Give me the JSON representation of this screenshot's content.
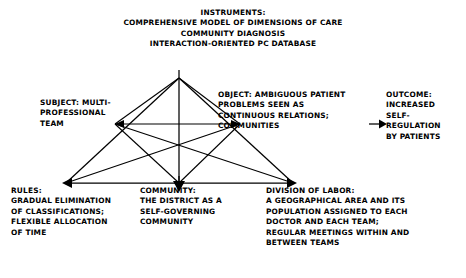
{
  "diagram": {
    "type": "activity-system-triangle",
    "title_text": "",
    "nodes": {
      "instruments": {
        "role": "INSTRUMENTS",
        "text": "INSTRUMENTS:\nCOMPREHENSIVE MODEL OF DIMENSIONS OF CARE\nCOMMUNITY DIAGNOSIS\nINTERACTION-ORIENTED PC DATABASE",
        "lines": [
          "INSTRUMENTS:",
          "COMPREHENSIVE MODEL OF DIMENSIONS OF CARE",
          "COMMUNITY DIAGNOSIS",
          "INTERACTION-ORIENTED PC DATABASE"
        ],
        "vertex": {
          "x": 179,
          "y": 78
        }
      },
      "subject": {
        "role": "SUBJECT",
        "text": "SUBJECT: MULTI-\nPROFESSIONAL\nTEAM",
        "lines": [
          "SUBJECT: MULTI-",
          "PROFESSIONAL",
          "TEAM"
        ],
        "vertex": {
          "x": 115,
          "y": 124
        }
      },
      "object": {
        "role": "OBJECT",
        "text": "OBJECT: AMBIGUOUS PATIENT\nPROBLEMS SEEN AS\nCONTINUOUS RELATIONS;\nCOMMUNITIES",
        "lines": [
          "OBJECT: AMBIGUOUS PATIENT",
          "   PROBLEMS SEEN AS",
          "      CONTINUOUS RELATIONS;",
          "      COMMUNITIES"
        ],
        "vertex": {
          "x": 240,
          "y": 124
        }
      },
      "outcome": {
        "role": "OUTCOME",
        "text": "OUTCOME:\nINCREASED\nSELF-\nREGULATION\nBY PATIENTS",
        "lines": [
          "OUTCOME:",
          "INCREASED",
          "SELF-",
          "REGULATION",
          "BY PATIENTS"
        ]
      },
      "rules": {
        "role": "RULES",
        "text": "RULES:\nGRADUAL ELIMINATION\nOF CLASSIFICATIONS;\nFLEXIBLE ALLOCATION\nOF TIME",
        "lines": [
          "RULES:",
          "GRADUAL ELIMINATION",
          "OF CLASSIFICATIONS;",
          "FLEXIBLE ALLOCATION",
          "OF TIME"
        ],
        "vertex": {
          "x": 66,
          "y": 183
        }
      },
      "community": {
        "role": "COMMUNITY",
        "text": "COMMUNITY:\nTHE DISTRICT AS A\nSELF-GOVERNING\nCOMMUNITY",
        "lines": [
          "COMMUNITY:",
          "THE DISTRICT AS A",
          "SELF-GOVERNING",
          "COMMUNITY"
        ],
        "vertex": {
          "x": 179,
          "y": 183
        }
      },
      "division_of_labor": {
        "role": "DIVISION OF LABOR",
        "text": "DIVISION OF LABOR:\nA GEOGRAPHICAL AREA AND ITS\nPOPULATION ASSIGNED TO EACH\nDOCTOR AND EACH TEAM;\nREGULAR MEETINGS WITHIN AND\nBETWEEN TEAMS",
        "lines": [
          "DIVISION OF LABOR:",
          "A GEOGRAPHICAL AREA AND ITS",
          "POPULATION ASSIGNED TO EACH",
          "DOCTOR AND EACH TEAM;",
          " REGULAR MEETINGS WITHIN AND",
          "BETWEEN TEAMS"
        ],
        "vertex": {
          "x": 293,
          "y": 183
        }
      }
    },
    "arrows": [
      {
        "name": "object-to-outcome",
        "direction": "right",
        "from": "object",
        "to": "outcome"
      },
      {
        "name": "subject-to-rules",
        "direction": "left",
        "from": "subject-area",
        "to": "rules"
      },
      {
        "name": "object-to-division",
        "direction": "right",
        "from": "object-area",
        "to": "division_of_labor"
      },
      {
        "name": "apex-to-community",
        "direction": "down",
        "from": "base",
        "to": "community"
      }
    ],
    "colors": {
      "stroke": "#000000",
      "text": "#000000",
      "background": "#ffffff"
    }
  }
}
